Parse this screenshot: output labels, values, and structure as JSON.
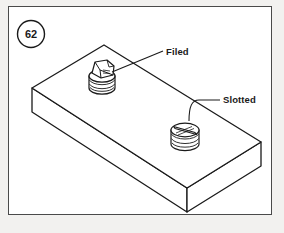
{
  "figure": {
    "number": "62",
    "frame": {
      "border_color": "#4a4a4a",
      "background": "#ffffff",
      "page_background": "#f2f1ef"
    }
  },
  "callouts": [
    {
      "id": "filed",
      "label": "Filed",
      "description": "Screw head that has been filed flat",
      "leader_style": "straight"
    },
    {
      "id": "slotted",
      "label": "Slotted",
      "description": "Screw head with a cut slot for a screwdriver",
      "leader_style": "curved"
    }
  ],
  "drawing": {
    "subject": "rectangular-plate-isometric",
    "line_color": "#1a1a1a",
    "face_fill": "#ffffff",
    "parts": [
      {
        "name": "plate",
        "type": "rectangular-block"
      },
      {
        "name": "filed-screw",
        "type": "screw-head-filed"
      },
      {
        "name": "slotted-screw",
        "type": "screw-head-slotted"
      }
    ]
  }
}
